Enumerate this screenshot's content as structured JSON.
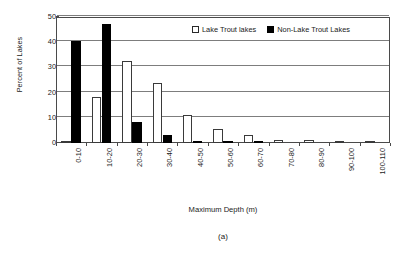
{
  "chart_data": {
    "type": "bar",
    "title": "",
    "subtitle": "",
    "panel_label": "(a)",
    "xlabel": "Maximum Depth (m)",
    "ylabel": "Percent of Lakes",
    "categories": [
      "0-10",
      "10-20",
      "20-30",
      "30-40",
      "40-50",
      "50-60",
      "60-70",
      "70-80",
      "80-90",
      "90-100",
      "100-110"
    ],
    "series": [
      {
        "name": "Lake Trout lakes",
        "style": "open",
        "color": "#ffffff",
        "edge_color": "#3a3a3a",
        "values": [
          0.8,
          18.4,
          32.5,
          23.8,
          11.0,
          5.4,
          3.3,
          1.3,
          1.0,
          0.4,
          0.5
        ]
      },
      {
        "name": "Non-Lake Trout Lakes",
        "style": "filled",
        "color": "#000000",
        "edge_color": "#000000",
        "values": [
          40.4,
          47.4,
          8.5,
          3.0,
          0.5,
          0.3,
          0.2,
          0.0,
          0.0,
          0.0,
          0.0
        ]
      }
    ],
    "ylim": [
      0,
      50
    ],
    "yticks": [
      0,
      10,
      20,
      30,
      40,
      50
    ],
    "ytick_labels": [
      "0",
      "10",
      "20",
      "30",
      "40",
      "50"
    ],
    "grid": "horizontal",
    "legend_position": "top-right-inside",
    "frame": "box"
  },
  "legend": {
    "entries": [
      {
        "label": "Lake Trout lakes",
        "style": "open"
      },
      {
        "label": "Non-Lake Trout Lakes",
        "style": "filled"
      }
    ]
  }
}
